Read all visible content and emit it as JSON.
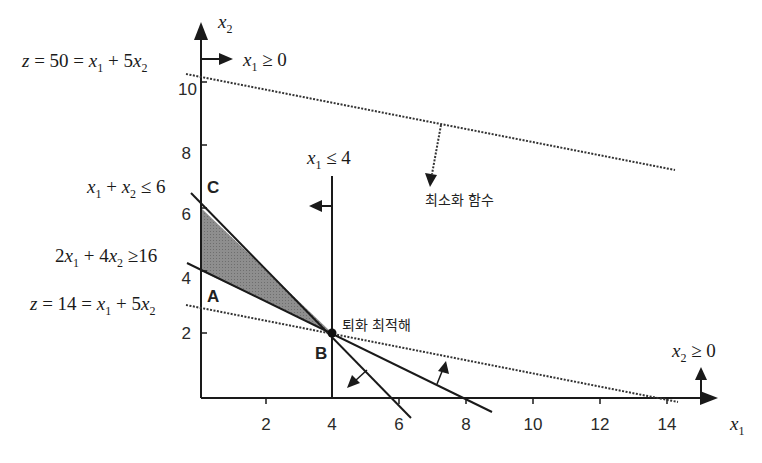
{
  "diagram": {
    "axes": {
      "x_label": "x1",
      "y_label": "x2",
      "x_ticks": [
        "2",
        "4",
        "6",
        "8",
        "10",
        "12",
        "14"
      ],
      "y_ticks": [
        "2",
        "4",
        "6",
        "8",
        "10"
      ]
    },
    "constraints": [
      {
        "id": "x1-nonneg",
        "label": "x₁ ≥ 0",
        "direction": "right"
      },
      {
        "id": "x2-nonneg",
        "label": "x₂ ≥ 0",
        "direction": "up"
      },
      {
        "id": "x1-le-4",
        "label": "x₁ ≤ 4",
        "direction": "left"
      },
      {
        "id": "sum-le-6",
        "label": "x₁ + x₂ ≤ 6",
        "direction": "down-left",
        "x_intercept": 6,
        "y_intercept": 6
      },
      {
        "id": "2x1-4x2-ge-16",
        "label": "2x₁ + 4x₂ ≥ 16",
        "direction": "up-right",
        "x_intercept": 8,
        "y_intercept": 4
      }
    ],
    "objective_lines": [
      {
        "id": "z50",
        "label": "z = 50 = x₁ + 5x₂",
        "style": "dotted",
        "y_intercept": 10
      },
      {
        "id": "z14",
        "label": "z = 14 = x₁ + 5x₂",
        "style": "dotted",
        "y_intercept": 2.8,
        "x_intercept": 14
      }
    ],
    "points": [
      {
        "id": "A",
        "label": "A",
        "x": 0,
        "y": 4
      },
      {
        "id": "B",
        "label": "B",
        "x": 4,
        "y": 2
      },
      {
        "id": "C",
        "label": "C",
        "x": 0,
        "y": 6
      }
    ],
    "annotations": {
      "minimize": "최소화 함수",
      "degenerate_optimum": "퇴화 최적해"
    },
    "feasible_region": {
      "vertices": [
        [
          0,
          6
        ],
        [
          0,
          4
        ],
        [
          4,
          2
        ]
      ],
      "fill": "#8a8a8a"
    },
    "colors": {
      "line": "#1a1a1a",
      "fill": "#8c8c8c"
    }
  }
}
